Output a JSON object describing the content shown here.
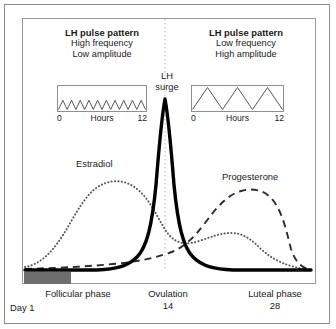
{
  "figure": {
    "accent_color": "#1a1a1a",
    "menses_bar_color": "#6e6e6e",
    "frame_color": "#8c8c8c"
  },
  "panels": {
    "left": {
      "title": "LH pulse pattern",
      "line1": "High frequency",
      "line2": "Low amplitude",
      "axis_start": "0",
      "axis_mid": "Hours",
      "axis_end": "12",
      "peaks": 10,
      "amplitude_ratio": 0.42
    },
    "right": {
      "title": "LH pulse pattern",
      "line1": "Low frequency",
      "line2": "High amplitude",
      "axis_start": "0",
      "axis_mid": "Hours",
      "axis_end": "12",
      "peaks": 3,
      "amplitude_ratio": 1.0
    }
  },
  "annotations": {
    "lh_surge_line1": "LH",
    "lh_surge_line2": "surge",
    "estradiol": "Estradiol",
    "progesterone": "Progesterone"
  },
  "axis": {
    "follicular_phase": "Follicular phase",
    "ovulation": "Ovulation",
    "ovulation_day": "14",
    "luteal_phase": "Luteal phase",
    "luteal_day": "28",
    "day_start": "Day 1"
  },
  "chart_data": {
    "type": "line",
    "xlabel": "Day of cycle",
    "ylabel": "Relative hormone concentration",
    "xlim": [
      1,
      28
    ],
    "ylim": [
      0,
      1
    ],
    "grid": false,
    "legend": "inline-labels",
    "x": [
      1,
      2,
      3,
      4,
      5,
      6,
      7,
      8,
      9,
      10,
      11,
      12,
      13,
      14,
      15,
      16,
      17,
      18,
      19,
      20,
      21,
      22,
      23,
      24,
      25,
      26,
      27,
      28
    ],
    "series": [
      {
        "name": "LH",
        "style": "solid-thick",
        "color": "#000000",
        "values": [
          0.02,
          0.02,
          0.02,
          0.02,
          0.02,
          0.02,
          0.02,
          0.02,
          0.03,
          0.04,
          0.06,
          0.14,
          0.52,
          0.94,
          0.62,
          0.18,
          0.06,
          0.03,
          0.02,
          0.02,
          0.02,
          0.02,
          0.02,
          0.02,
          0.02,
          0.02,
          0.02,
          0.02
        ]
      },
      {
        "name": "Estradiol",
        "style": "dotted",
        "color": "#555555",
        "values": [
          0.05,
          0.06,
          0.08,
          0.11,
          0.16,
          0.23,
          0.32,
          0.41,
          0.49,
          0.55,
          0.58,
          0.59,
          0.57,
          0.5,
          0.41,
          0.33,
          0.29,
          0.29,
          0.31,
          0.33,
          0.34,
          0.33,
          0.3,
          0.25,
          0.2,
          0.14,
          0.09,
          0.04
        ]
      },
      {
        "name": "Progesterone",
        "style": "dashed",
        "color": "#333333",
        "values": [
          0.03,
          0.03,
          0.03,
          0.03,
          0.04,
          0.04,
          0.05,
          0.05,
          0.06,
          0.06,
          0.07,
          0.08,
          0.09,
          0.1,
          0.13,
          0.22,
          0.36,
          0.48,
          0.56,
          0.6,
          0.61,
          0.6,
          0.56,
          0.49,
          0.39,
          0.27,
          0.15,
          0.04
        ]
      }
    ],
    "markers": [
      {
        "name": "ovulation-line",
        "x": 14,
        "style": "dotted-vertical"
      },
      {
        "name": "menstruation-bar",
        "x_start": 1,
        "x_end": 5
      }
    ]
  }
}
